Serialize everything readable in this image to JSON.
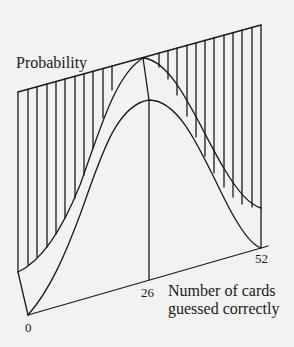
{
  "diagram": {
    "type": "3d-surface-sketch",
    "ylabel": "Probability",
    "xlabel_line1": "Number of cards",
    "xlabel_line2": "guessed correctly",
    "ticks": {
      "t0": "0",
      "t26": "26",
      "t52": "52"
    },
    "colors": {
      "background": "#f2f2f0",
      "stroke": "#1a1a1a"
    }
  }
}
